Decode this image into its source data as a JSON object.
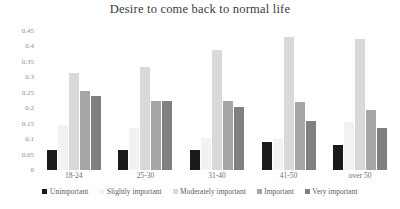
{
  "chart_data": {
    "type": "bar",
    "title": "Desire to come back to normal life",
    "xlabel": "",
    "ylabel": "",
    "ylim": [
      0,
      0.45
    ],
    "grid": false,
    "legend_position": "bottom",
    "yticks": [
      "0",
      "0.05",
      "0.1",
      "0.15",
      "0.2",
      "0.25",
      "0.3",
      "0.35",
      "0.4",
      "0.45"
    ],
    "ytick_values": [
      0,
      0.05,
      0.1,
      0.15,
      0.2,
      0.25,
      0.3,
      0.35,
      0.4,
      0.45
    ],
    "categories": [
      "18-24",
      "25-30",
      "31-40",
      "41-50",
      "over 50"
    ],
    "series": [
      {
        "name": "Unimportant",
        "color": "#1a1a1a",
        "values": [
          0.065,
          0.065,
          0.065,
          0.09,
          0.08
        ]
      },
      {
        "name": "Slightly important",
        "color": "#f2f2f2",
        "values": [
          0.145,
          0.135,
          0.105,
          0.1,
          0.155
        ]
      },
      {
        "name": "Moderately important",
        "color": "#d9d9d9",
        "values": [
          0.315,
          0.335,
          0.39,
          0.43,
          0.425
        ]
      },
      {
        "name": "Important",
        "color": "#a6a6a6",
        "values": [
          0.255,
          0.225,
          0.225,
          0.22,
          0.195
        ]
      },
      {
        "name": "Very important",
        "color": "#808080",
        "values": [
          0.24,
          0.225,
          0.205,
          0.16,
          0.135
        ]
      }
    ]
  }
}
